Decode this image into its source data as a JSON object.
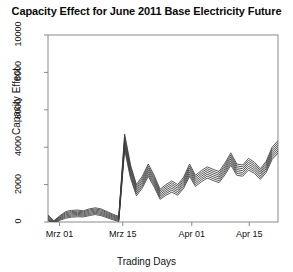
{
  "chart_data": {
    "type": "line",
    "title": "Capacity Effect for June 2011 Base Electricity Future",
    "xlabel": "Trading Days",
    "ylabel": "Capacity Effect",
    "ylim": [
      0,
      10000
    ],
    "yticks": [
      0,
      2000,
      4000,
      6000,
      8000,
      10000
    ],
    "ytick_labels": [
      "0",
      "2000",
      "4000",
      "6000",
      "8000",
      "10000"
    ],
    "xlim": [
      0,
      40
    ],
    "xticks": [
      2,
      13,
      25,
      35
    ],
    "xtick_labels": [
      "Mrz 01",
      "Mrz 15",
      "Apr 01",
      "Apr 15"
    ],
    "grid": false,
    "legend": false,
    "legend_position": "none",
    "box": true,
    "line_color": "#3a3a3a",
    "series": [
      {
        "name": "band-1",
        "values": [
          380,
          70,
          330,
          560,
          620,
          640,
          600,
          700,
          760,
          700,
          560,
          420,
          300,
          4700,
          3050,
          2000,
          2450,
          3100,
          2500,
          1750,
          2000,
          2200,
          2000,
          2400,
          3100,
          2500,
          2750,
          2950,
          2820,
          2700,
          3150,
          3700,
          3100,
          3050,
          3400,
          3200,
          2850,
          3250,
          4000,
          4350
        ]
      },
      {
        "name": "band-2",
        "values": [
          330,
          40,
          290,
          500,
          560,
          580,
          545,
          640,
          700,
          640,
          505,
          370,
          255,
          4560,
          2930,
          1900,
          2345,
          2990,
          2395,
          1660,
          1905,
          2100,
          1905,
          2300,
          2990,
          2400,
          2650,
          2850,
          2720,
          2600,
          3045,
          3590,
          3000,
          2950,
          3295,
          3100,
          2755,
          3150,
          3890,
          4240
        ]
      },
      {
        "name": "band-3",
        "values": [
          280,
          10,
          250,
          440,
          500,
          520,
          490,
          580,
          640,
          580,
          450,
          320,
          210,
          4420,
          2810,
          1800,
          2240,
          2880,
          2290,
          1570,
          1810,
          2000,
          1810,
          2200,
          2880,
          2300,
          2550,
          2750,
          2620,
          2500,
          2940,
          3480,
          2900,
          2850,
          3190,
          3000,
          2660,
          3050,
          3780,
          4130
        ]
      },
      {
        "name": "band-4",
        "values": [
          230,
          -20,
          210,
          380,
          440,
          460,
          435,
          520,
          580,
          520,
          395,
          270,
          165,
          4280,
          2690,
          1700,
          2135,
          2770,
          2185,
          1480,
          1715,
          1900,
          1715,
          2100,
          2770,
          2200,
          2450,
          2650,
          2520,
          2400,
          2835,
          3370,
          2800,
          2750,
          3085,
          2900,
          2565,
          2950,
          3670,
          4020
        ]
      },
      {
        "name": "band-5",
        "values": [
          180,
          -50,
          170,
          320,
          380,
          400,
          380,
          460,
          520,
          460,
          340,
          220,
          120,
          4140,
          2570,
          1600,
          2030,
          2660,
          2080,
          1390,
          1620,
          1800,
          1620,
          2000,
          2660,
          2100,
          2350,
          2550,
          2420,
          2300,
          2730,
          3260,
          2700,
          2650,
          2980,
          2800,
          2470,
          2850,
          3560,
          3910
        ]
      },
      {
        "name": "band-6",
        "values": [
          130,
          -80,
          130,
          260,
          320,
          340,
          325,
          400,
          460,
          400,
          285,
          170,
          75,
          4000,
          2450,
          1500,
          1925,
          2550,
          1975,
          1300,
          1525,
          1700,
          1525,
          1900,
          2550,
          2000,
          2250,
          2450,
          2320,
          2200,
          2625,
          3150,
          2600,
          2550,
          2875,
          2700,
          2375,
          2750,
          3450,
          3800
        ]
      },
      {
        "name": "band-7",
        "values": [
          80,
          -110,
          90,
          200,
          260,
          280,
          270,
          340,
          400,
          340,
          230,
          120,
          30,
          3860,
          2330,
          1400,
          1820,
          2440,
          1870,
          1210,
          1430,
          1600,
          1430,
          1800,
          2440,
          1900,
          2150,
          2350,
          2220,
          2100,
          2520,
          3040,
          2500,
          2450,
          2770,
          2600,
          2280,
          2650,
          3340,
          3690
        ]
      }
    ]
  }
}
